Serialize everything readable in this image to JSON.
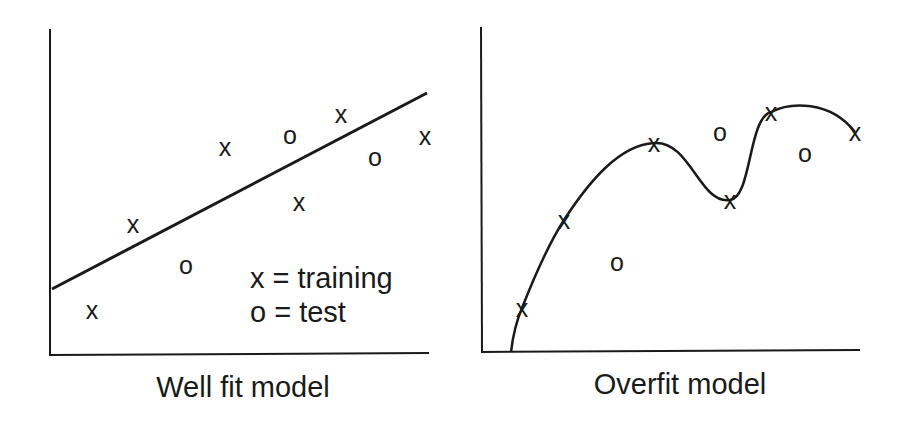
{
  "panels": [
    {
      "id": "well-fit",
      "title": "Well fit model",
      "legend": [
        "x = training",
        "o = test"
      ],
      "fit": "linear"
    },
    {
      "id": "overfit",
      "title": "Overfit model",
      "fit": "high-order curve through training points"
    }
  ],
  "chart_data": [
    {
      "type": "scatter",
      "title": "Well fit model",
      "xlabel": "",
      "ylabel": "",
      "grid": false,
      "legend_position": "lower right inside",
      "legend": [
        "x = training",
        "o = test"
      ],
      "series": [
        {
          "name": "training",
          "marker": "x",
          "points": [
            [
              92,
              310
            ],
            [
              133,
              224
            ],
            [
              225,
              147
            ],
            [
              341,
              114
            ],
            [
              299,
              202
            ],
            [
              425,
              136
            ]
          ]
        },
        {
          "name": "test",
          "marker": "o",
          "points": [
            [
              186,
              265
            ],
            [
              290,
              135
            ],
            [
              375,
              157
            ]
          ]
        },
        {
          "name": "model",
          "kind": "line",
          "points": [
            [
              52,
              289
            ],
            [
              427,
              93
            ]
          ]
        }
      ]
    },
    {
      "type": "scatter",
      "title": "Overfit model",
      "xlabel": "",
      "ylabel": "",
      "grid": false,
      "series": [
        {
          "name": "training",
          "marker": "x",
          "points": [
            [
              522,
              308
            ],
            [
              564,
              220
            ],
            [
              654,
              143
            ],
            [
              730,
              200
            ],
            [
              771,
              112
            ],
            [
              855,
              132
            ]
          ]
        },
        {
          "name": "test",
          "marker": "o",
          "points": [
            [
              617,
              262
            ],
            [
              720,
              132
            ],
            [
              805,
              153
            ]
          ]
        },
        {
          "name": "model",
          "kind": "curve",
          "points": [
            [
              511,
              352
            ],
            [
              522,
              308
            ],
            [
              564,
              220
            ],
            [
              654,
              143
            ],
            [
              730,
              200
            ],
            [
              771,
              112
            ],
            [
              855,
              132
            ]
          ]
        }
      ]
    }
  ]
}
